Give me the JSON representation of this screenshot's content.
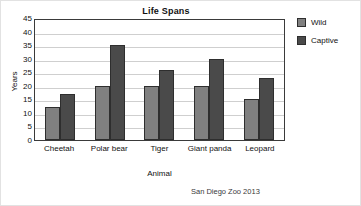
{
  "chart_data": {
    "type": "bar",
    "title": "Life Spans",
    "xlabel": "Animal",
    "ylabel": "Years",
    "categories": [
      "Cheetah",
      "Polar bear",
      "Tiger",
      "Giant panda",
      "Leopard"
    ],
    "series": [
      {
        "name": "Wild",
        "color": "#808080",
        "values": [
          12,
          20,
          20,
          20,
          15
        ]
      },
      {
        "name": "Captive",
        "color": "#4a4a4a",
        "values": [
          17,
          35,
          26,
          30,
          23
        ]
      }
    ],
    "ylim": [
      0,
      45
    ],
    "ytick_step": 5,
    "yticks": [
      45,
      40,
      35,
      30,
      25,
      20,
      15,
      10,
      5,
      0
    ],
    "ytick_labels": [
      "45",
      "40",
      "35",
      "30",
      "25",
      "20",
      "15",
      "10",
      "5",
      "0"
    ],
    "grid": true,
    "grid_axis": "y",
    "legend_position": "right",
    "annotation": "San Diego Zoo 2013"
  },
  "source": {
    "label": "San Diego Zoo 2013"
  },
  "legend": {
    "entries": [
      {
        "label": "Wild"
      },
      {
        "label": "Captive"
      }
    ]
  }
}
